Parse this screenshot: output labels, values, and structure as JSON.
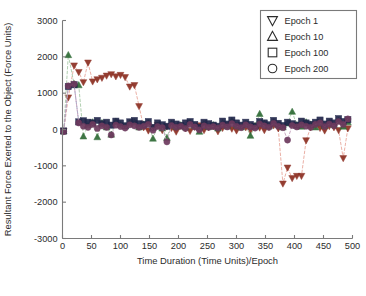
{
  "chart_data": {
    "type": "scatter",
    "title": "",
    "xlabel": "Time Duration (Time Units)/Epoch",
    "ylabel": "Resultant Force Exerted to the Object (Force Units)",
    "xlim": [
      0,
      500
    ],
    "ylim": [
      -3000,
      3000
    ],
    "xticks": [
      0,
      50,
      100,
      150,
      200,
      250,
      300,
      350,
      400,
      450,
      500
    ],
    "yticks": [
      -3000,
      -2000,
      -1000,
      0,
      1000,
      2000,
      3000
    ],
    "xticklabels": [
      "0",
      "50",
      "100",
      "150",
      "200",
      "250",
      "300",
      "350",
      "400",
      "450",
      "500"
    ],
    "yticklabels": [
      "-3000",
      "-2000",
      "-1000",
      "0",
      "1000",
      "2000",
      "3000"
    ],
    "grid": false,
    "legend_position": "upper right",
    "legend_entries": [
      "Epoch 1",
      "Epoch 10",
      "Epoch 100",
      "Epoch 200"
    ],
    "series": [
      {
        "name": "Epoch 1",
        "marker": "down-triangle",
        "color": "#8c2f22",
        "line_color": "#e8a79c",
        "line_style": "dashed",
        "x": [
          2,
          10,
          20,
          28,
          36,
          44,
          52,
          60,
          68,
          76,
          84,
          92,
          100,
          108,
          116,
          124,
          132,
          140,
          148,
          156,
          164,
          172,
          180,
          188,
          196,
          204,
          212,
          220,
          228,
          236,
          244,
          252,
          260,
          268,
          276,
          284,
          292,
          300,
          308,
          316,
          324,
          332,
          340,
          348,
          356,
          364,
          372,
          380,
          388,
          396,
          404,
          412,
          420,
          428,
          436,
          444,
          452,
          460,
          468,
          476,
          484,
          492
        ],
        "y": [
          -40,
          880,
          1760,
          1580,
          1300,
          1840,
          1320,
          1380,
          1420,
          1480,
          1520,
          1460,
          1500,
          1440,
          1180,
          1220,
          640,
          60,
          -30,
          50,
          120,
          -20,
          80,
          40,
          -60,
          100,
          30,
          -40,
          70,
          110,
          -20,
          60,
          90,
          -50,
          40,
          120,
          20,
          -30,
          80,
          60,
          -40,
          100,
          50,
          -20,
          70,
          110,
          30,
          -1490,
          -1050,
          -1340,
          -1280,
          -1280,
          -300,
          60,
          120,
          40,
          -30,
          90,
          60,
          -20,
          -790,
          30
        ]
      },
      {
        "name": "Epoch 10",
        "marker": "up-triangle",
        "color": "#2e6b35",
        "line_color": "#a8c9a8",
        "line_style": "dashed",
        "x": [
          2,
          10,
          20,
          28,
          36,
          44,
          52,
          60,
          68,
          76,
          84,
          92,
          100,
          108,
          116,
          124,
          132,
          140,
          148,
          156,
          164,
          172,
          180,
          188,
          196,
          204,
          212,
          220,
          228,
          236,
          244,
          252,
          260,
          268,
          276,
          284,
          292,
          300,
          308,
          316,
          324,
          332,
          340,
          348,
          356,
          364,
          372,
          380,
          388,
          396,
          404,
          412,
          420,
          428,
          436,
          444,
          452,
          460,
          468,
          476,
          484,
          492
        ],
        "y": [
          -50,
          2050,
          1250,
          1220,
          -190,
          120,
          200,
          -210,
          180,
          60,
          -140,
          220,
          130,
          90,
          170,
          200,
          60,
          140,
          180,
          -250,
          100,
          30,
          -230,
          160,
          80,
          120,
          60,
          190,
          100,
          -60,
          150,
          70,
          120,
          30,
          180,
          90,
          240,
          110,
          60,
          150,
          -170,
          100,
          430,
          160,
          90,
          200,
          130,
          60,
          170,
          490,
          120,
          80,
          200,
          140,
          60,
          170,
          100,
          190,
          130,
          240,
          80,
          200
        ]
      },
      {
        "name": "Epoch 100",
        "marker": "square",
        "color": "#21264a",
        "line_color": "#9aa0c0",
        "line_style": "dashed",
        "x": [
          2,
          10,
          20,
          28,
          36,
          44,
          52,
          60,
          68,
          76,
          84,
          92,
          100,
          108,
          116,
          124,
          132,
          140,
          148,
          156,
          164,
          172,
          180,
          188,
          196,
          204,
          212,
          220,
          228,
          236,
          244,
          252,
          260,
          268,
          276,
          284,
          292,
          300,
          308,
          316,
          324,
          332,
          340,
          348,
          356,
          364,
          372,
          380,
          388,
          396,
          404,
          412,
          420,
          428,
          436,
          444,
          452,
          460,
          468,
          476,
          484,
          492
        ],
        "y": [
          -40,
          1180,
          1230,
          210,
          240,
          200,
          180,
          250,
          160,
          200,
          120,
          230,
          180,
          100,
          210,
          250,
          160,
          140,
          220,
          60,
          180,
          130,
          90,
          200,
          150,
          110,
          180,
          220,
          140,
          60,
          200,
          160,
          120,
          90,
          230,
          150,
          260,
          180,
          120,
          200,
          140,
          90,
          220,
          180,
          130,
          250,
          170,
          110,
          200,
          160,
          120,
          230,
          180,
          140,
          200,
          260,
          150,
          230,
          180,
          300,
          220,
          270
        ]
      },
      {
        "name": "Epoch 200",
        "marker": "circle",
        "color": "#6d3a5e",
        "line_color": "#c4a0bc",
        "line_style": "dashed",
        "x": [
          2,
          10,
          20,
          28,
          36,
          44,
          52,
          60,
          68,
          76,
          84,
          92,
          100,
          108,
          116,
          124,
          132,
          140,
          148,
          156,
          164,
          172,
          180,
          188,
          196,
          204,
          212,
          220,
          228,
          236,
          244,
          252,
          260,
          268,
          276,
          284,
          292,
          300,
          308,
          316,
          324,
          332,
          340,
          348,
          356,
          364,
          372,
          380,
          388,
          396,
          404,
          412,
          420,
          428,
          436,
          444,
          452,
          460,
          468,
          476,
          484,
          492
        ],
        "y": [
          -60,
          1200,
          1250,
          180,
          90,
          60,
          140,
          30,
          100,
          60,
          -150,
          120,
          80,
          40,
          130,
          100,
          60,
          90,
          140,
          -20,
          80,
          50,
          -340,
          110,
          60,
          90,
          30,
          140,
          70,
          -10,
          100,
          60,
          80,
          40,
          120,
          70,
          160,
          90,
          50,
          130,
          70,
          40,
          150,
          100,
          60,
          170,
          90,
          50,
          -290,
          110,
          70,
          130,
          90,
          60,
          140,
          180,
          80,
          150,
          100,
          220,
          140,
          290
        ]
      }
    ]
  },
  "legend": {
    "items": [
      {
        "label": "Epoch 1",
        "glyph": "down-triangle-icon"
      },
      {
        "label": "Epoch 10",
        "glyph": "up-triangle-icon"
      },
      {
        "label": "Epoch 100",
        "glyph": "square-icon"
      },
      {
        "label": "Epoch 200",
        "glyph": "circle-icon"
      }
    ]
  },
  "colors": {
    "axis": "#7a7a7a",
    "text": "#2b2b2b",
    "background": "#ffffff",
    "epoch1": "#8c2f22",
    "epoch10": "#2e6b35",
    "epoch100": "#21264a",
    "epoch200": "#6d3a5e"
  }
}
